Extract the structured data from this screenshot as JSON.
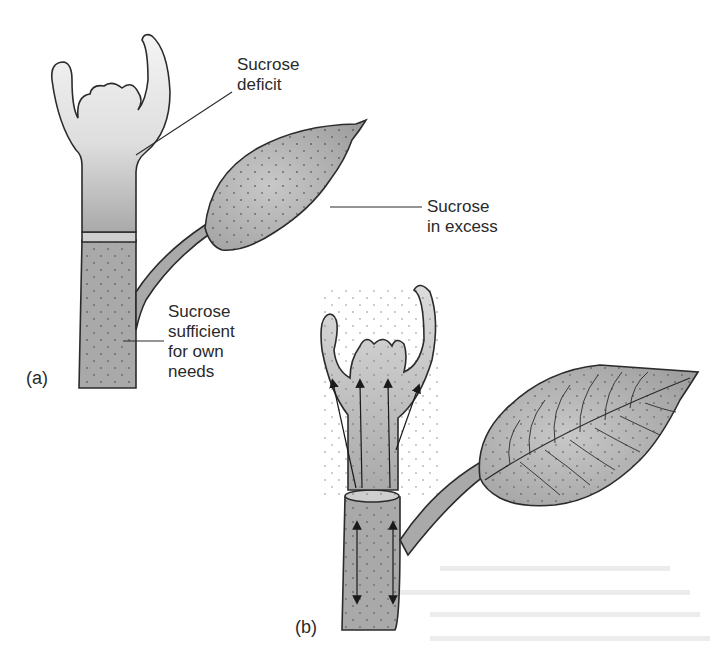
{
  "figure": {
    "colors": {
      "tissue_fill": "#a9a9a9",
      "tissue_light": "#e4e4e4",
      "outline": "#2b2b2b",
      "text": "#2a2a2a",
      "background": "#ffffff"
    }
  },
  "panel_a": {
    "label": "(a)",
    "callouts": [
      {
        "id": "apex",
        "line1": "Sucrose",
        "line2": "deficit"
      },
      {
        "id": "leaf",
        "line1": "Sucrose",
        "line2": "in excess"
      },
      {
        "id": "stem",
        "line1": "Sucrose",
        "line2": "sufficient",
        "line3": "for own",
        "line4": "needs"
      }
    ]
  },
  "panel_b": {
    "label": "(b)",
    "arrows": {
      "apex_up": 4,
      "stem_bidirectional": 2
    }
  }
}
